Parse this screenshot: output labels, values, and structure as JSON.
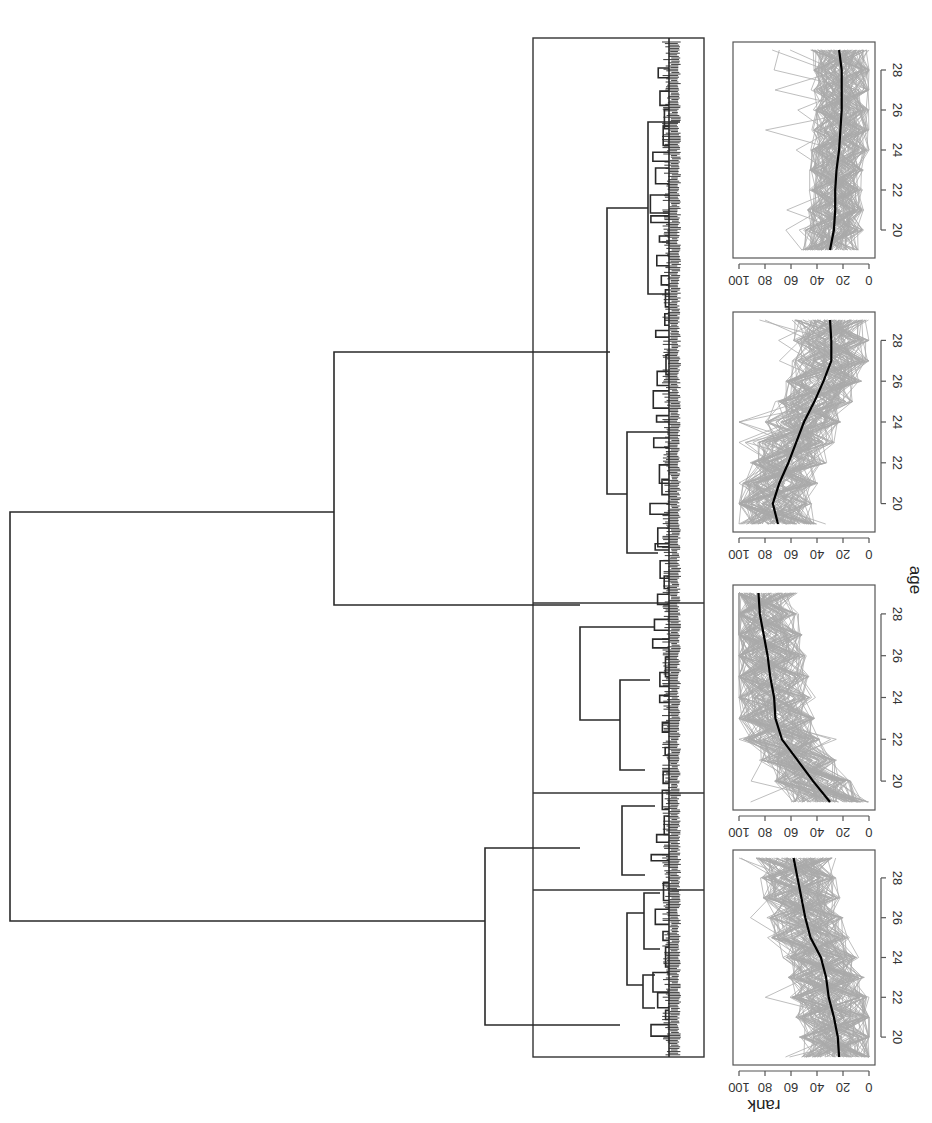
{
  "figure": {
    "orientation": "rotated 90 degrees clockwise",
    "colors": {
      "trajectories": "#a9a9a9",
      "mean_line": "#000000",
      "dendrogram": "#2a2a2a"
    }
  },
  "chart_data": [
    {
      "type": "dendrogram",
      "title": "",
      "description": "Hierarchical clustering dendrogram of rank trajectories, cut into 4 clusters (boxed)",
      "n_clusters": 4,
      "clusters": [
        "cluster 1",
        "cluster 2",
        "cluster 3",
        "cluster 4"
      ],
      "relative_leaf_share": [
        0.27,
        0.1,
        0.19,
        0.44
      ]
    },
    {
      "type": "line",
      "panel": "cluster 1",
      "xlabel": "age",
      "ylabel": "rank",
      "xlim": [
        19,
        29
      ],
      "ylim": [
        0,
        100
      ],
      "xticks": [
        20,
        22,
        24,
        26,
        28
      ],
      "yticks": [
        0,
        20,
        40,
        60,
        80,
        100
      ],
      "series": [
        {
          "name": "mean",
          "x": [
            19,
            20,
            21,
            22,
            23,
            24,
            25,
            26,
            27,
            28,
            29
          ],
          "values": [
            23,
            24,
            27,
            31,
            33,
            37,
            45,
            49,
            52,
            55,
            58
          ]
        }
      ]
    },
    {
      "type": "line",
      "panel": "cluster 2",
      "xlabel": "age",
      "ylabel": "rank",
      "xlim": [
        19,
        29
      ],
      "ylim": [
        0,
        100
      ],
      "xticks": [
        20,
        22,
        24,
        26,
        28
      ],
      "yticks": [
        0,
        20,
        40,
        60,
        80,
        100
      ],
      "series": [
        {
          "name": "mean",
          "x": [
            19,
            20,
            21,
            22,
            23,
            24,
            25,
            26,
            27,
            28,
            29
          ],
          "values": [
            30,
            43,
            55,
            67,
            72,
            73,
            76,
            78,
            81,
            84,
            85
          ]
        }
      ]
    },
    {
      "type": "line",
      "panel": "cluster 3",
      "xlabel": "age",
      "ylabel": "rank",
      "xlim": [
        19,
        29
      ],
      "ylim": [
        0,
        100
      ],
      "xticks": [
        20,
        22,
        24,
        26,
        28
      ],
      "yticks": [
        0,
        20,
        40,
        60,
        80,
        100
      ],
      "series": [
        {
          "name": "mean",
          "x": [
            19,
            20,
            21,
            22,
            23,
            24,
            25,
            26,
            27,
            28,
            29
          ],
          "values": [
            70,
            74,
            69,
            62,
            56,
            50,
            42,
            35,
            29,
            29,
            30
          ]
        }
      ]
    },
    {
      "type": "line",
      "panel": "cluster 4",
      "xlabel": "age",
      "ylabel": "rank",
      "xlim": [
        19,
        29
      ],
      "ylim": [
        0,
        100
      ],
      "xticks": [
        20,
        22,
        24,
        26,
        28
      ],
      "yticks": [
        0,
        20,
        40,
        60,
        80,
        100
      ],
      "series": [
        {
          "name": "mean",
          "x": [
            19,
            20,
            21,
            22,
            23,
            24,
            25,
            26,
            27,
            28,
            29
          ],
          "values": [
            30,
            27,
            26,
            26,
            25,
            23,
            22,
            21,
            21,
            21,
            23
          ]
        }
      ]
    }
  ],
  "labels": {
    "ylabel": "rank",
    "xlabel": "age",
    "yticks": [
      "0",
      "20",
      "40",
      "60",
      "80",
      "100"
    ],
    "xticks": [
      "20",
      "22",
      "24",
      "26",
      "28"
    ]
  }
}
